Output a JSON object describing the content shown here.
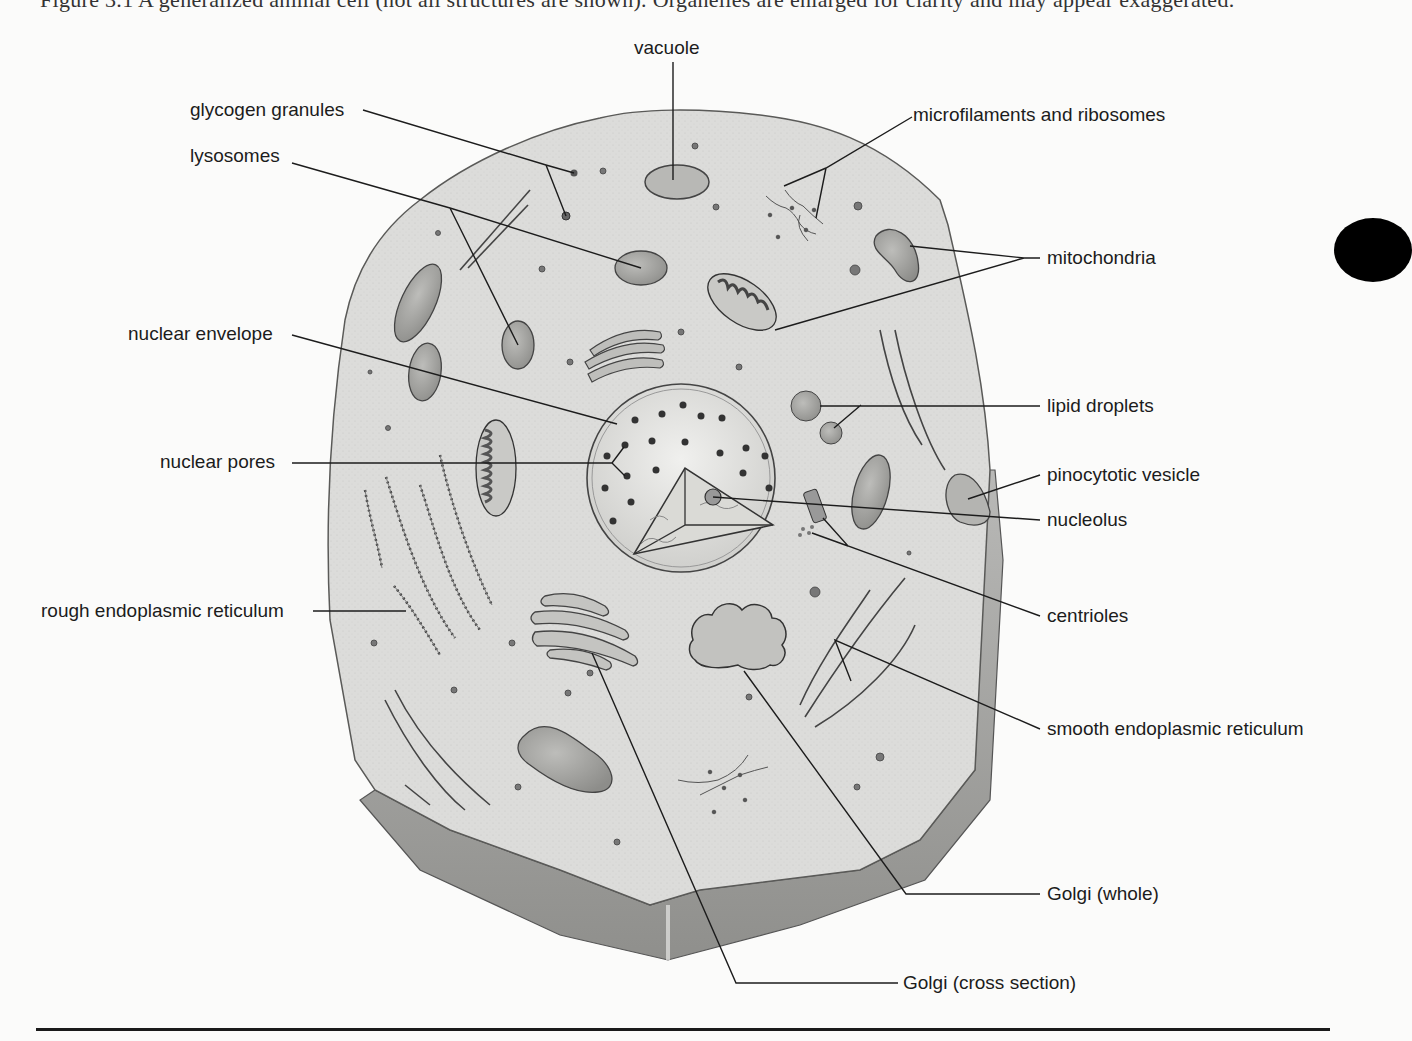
{
  "figure": {
    "top_cut_text": "Figure 3.1 A generalized animal cell (not all structures are shown). Organelles are enlarged for clarity and may appear exaggerated.",
    "subject": "generalized animal cell",
    "colors": {
      "cytoplasm": "#d9d9d7",
      "cell_edge": "#7a7a78",
      "ink": "#1c1c1c",
      "background": "#fbfbfa",
      "organelle": "#a8a8a5"
    }
  },
  "labels": {
    "vacuole": "vacuole",
    "glycogen_granules": "glycogen granules",
    "lysosomes": "lysosomes",
    "microfilaments_ribosomes": "microfilaments and ribosomes",
    "mitochondria": "mitochondria",
    "nuclear_envelope": "nuclear envelope",
    "lipid_droplets": "lipid droplets",
    "nuclear_pores": "nuclear pores",
    "pinocytotic_vesicle": "pinocytotic vesicle",
    "nucleolus": "nucleolus",
    "rough_er": "rough endoplasmic reticulum",
    "centrioles": "centrioles",
    "smooth_er": "smooth endoplasmic reticulum",
    "golgi_whole": "Golgi (whole)",
    "golgi_cross": "Golgi (cross section)"
  }
}
